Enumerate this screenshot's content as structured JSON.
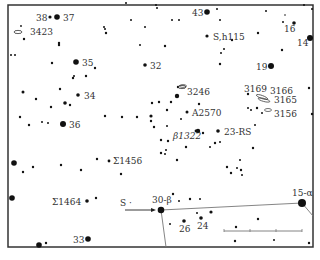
{
  "frame": {
    "x": 8,
    "y": 5,
    "w": 305,
    "h": 242,
    "stroke": "#333333"
  },
  "colors": {
    "ink": "#111111",
    "line": "#777777",
    "text": "#333333"
  },
  "labeled_objects": [
    {
      "id": "38",
      "label": "38",
      "x": 50,
      "y": 17,
      "r": 1.6,
      "lx": 36,
      "ly": 21
    },
    {
      "id": "37",
      "label": "37",
      "x": 57,
      "y": 17,
      "r": 2.8,
      "lx": 63,
      "ly": 21
    },
    {
      "id": "3423",
      "label": "3423",
      "x": 23,
      "y": 31,
      "r": 0,
      "lx": 30,
      "ly": 35,
      "galaxy": true
    },
    {
      "id": "35",
      "label": "35",
      "x": 76,
      "y": 62,
      "r": 2.8,
      "lx": 82,
      "ly": 66
    },
    {
      "id": "32",
      "label": "32",
      "x": 145,
      "y": 65,
      "r": 1.8,
      "lx": 150,
      "ly": 69
    },
    {
      "id": "34",
      "label": "34",
      "x": 78,
      "y": 95,
      "r": 1.8,
      "lx": 84,
      "ly": 99
    },
    {
      "id": "36",
      "label": "36",
      "x": 63,
      "y": 124,
      "r": 3.0,
      "lx": 69,
      "ly": 128
    },
    {
      "id": "43",
      "label": "43",
      "x": 207,
      "y": 12,
      "r": 2.8,
      "lx": 192,
      "ly": 16
    },
    {
      "id": "S,h115",
      "label": "S,h115",
      "x": 207,
      "y": 36,
      "r": 1.6,
      "lx": 213,
      "ly": 40
    },
    {
      "id": "16",
      "label": "16",
      "x": 294,
      "y": 23,
      "r": 1.8,
      "lx": 284,
      "ly": 32
    },
    {
      "id": "14",
      "label": "14",
      "x": 310,
      "y": 38,
      "r": 3.0,
      "lx": 297,
      "ly": 46
    },
    {
      "id": "19",
      "label": "19",
      "x": 271,
      "y": 66,
      "r": 3.0,
      "lx": 256,
      "ly": 70
    },
    {
      "id": "3246",
      "label": "3246",
      "x": 187,
      "y": 86,
      "r": 0,
      "lx": 187,
      "ly": 95,
      "galaxy": true
    },
    {
      "id": "A2570",
      "label": "A2570",
      "x": 187,
      "y": 112,
      "r": 1.5,
      "lx": 192,
      "ly": 116
    },
    {
      "id": "23-RS",
      "label": "23-RS",
      "x": 218,
      "y": 131,
      "r": 1.8,
      "lx": 224,
      "ly": 135
    },
    {
      "id": "B1322",
      "label": "β1322",
      "x": 198,
      "y": 131,
      "r": 2.2,
      "lx": 173,
      "ly": 139,
      "italic": true
    },
    {
      "id": "3169",
      "label": "3169",
      "x": 248,
      "y": 94,
      "r": 1.2,
      "lx": 244,
      "ly": 92
    },
    {
      "id": "3166",
      "label": "3166",
      "x": 0,
      "y": 0,
      "r": 0,
      "lx": 270,
      "ly": 94
    },
    {
      "id": "3165",
      "label": "3165",
      "x": 0,
      "y": 0,
      "r": 0,
      "lx": 274,
      "ly": 103
    },
    {
      "id": "3156",
      "label": "3156",
      "x": 0,
      "y": 0,
      "r": 0,
      "lx": 274,
      "ly": 117
    },
    {
      "id": "S1456",
      "label": "Σ1456",
      "x": 109,
      "y": 161,
      "r": 1.4,
      "lx": 113,
      "ly": 164
    },
    {
      "id": "S1464",
      "label": "Σ1464",
      "x": 87,
      "y": 201,
      "r": 1.8,
      "lx": 52,
      "ly": 205
    },
    {
      "id": "S",
      "label": "S ·",
      "x": 0,
      "y": 0,
      "r": 0,
      "lx": 120,
      "ly": 206
    },
    {
      "id": "30-B",
      "label": "30-β",
      "x": 161,
      "y": 210,
      "r": 3.3,
      "lx": 152,
      "ly": 203
    },
    {
      "id": "26",
      "label": "26",
      "x": 184,
      "y": 221,
      "r": 1.8,
      "lx": 179,
      "ly": 232
    },
    {
      "id": "24",
      "label": "24",
      "x": 201,
      "y": 218,
      "r": 1.8,
      "lx": 197,
      "ly": 229
    },
    {
      "id": "15-a",
      "label": "15-α",
      "x": 302,
      "y": 203,
      "r": 4.0,
      "lx": 292,
      "ly": 196
    },
    {
      "id": "33",
      "label": "33",
      "x": 88,
      "y": 239,
      "r": 2.8,
      "lx": 73,
      "ly": 243
    }
  ],
  "stars": [
    [
      21,
      26,
      0.9
    ],
    [
      24,
      39,
      1.2
    ],
    [
      59,
      45,
      1.2
    ],
    [
      11,
      55,
      1.0
    ],
    [
      15,
      55,
      1.0
    ],
    [
      52,
      63,
      1.2
    ],
    [
      95,
      68,
      1.2
    ],
    [
      73,
      78,
      1.2
    ],
    [
      74,
      76,
      1.0
    ],
    [
      86,
      76,
      1.2
    ],
    [
      23,
      92,
      1.5
    ],
    [
      36,
      99,
      1.2
    ],
    [
      60,
      89,
      1.2
    ],
    [
      65,
      103,
      1.8
    ],
    [
      70,
      105,
      1.2
    ],
    [
      51,
      107,
      1.2
    ],
    [
      20,
      117,
      1.2
    ],
    [
      29,
      125,
      1.2
    ],
    [
      42,
      122,
      1.0
    ],
    [
      48,
      123,
      1.0
    ],
    [
      105,
      116,
      1.2
    ],
    [
      122,
      117,
      1.2
    ],
    [
      137,
      117,
      1.2
    ],
    [
      151,
      116,
      1.6
    ],
    [
      159,
      102,
      1.2
    ],
    [
      14,
      163,
      2.8
    ],
    [
      23,
      172,
      1.2
    ],
    [
      33,
      167,
      1.2
    ],
    [
      61,
      165,
      1.2
    ],
    [
      81,
      170,
      1.2
    ],
    [
      97,
      159,
      1.2
    ],
    [
      121,
      174,
      1.2
    ],
    [
      12,
      198,
      2.8
    ],
    [
      96,
      198,
      1.2
    ],
    [
      39,
      245,
      2.8
    ],
    [
      46,
      243,
      1.2
    ],
    [
      156,
      5,
      1.0
    ],
    [
      172,
      20,
      1.0
    ],
    [
      179,
      20,
      1.0
    ],
    [
      104,
      27,
      1.0
    ],
    [
      106,
      33,
      1.2
    ],
    [
      105,
      29,
      1.0
    ],
    [
      59,
      43,
      1.2
    ],
    [
      165,
      46,
      1.2
    ],
    [
      157,
      8,
      1.0
    ],
    [
      220,
      20,
      1.0
    ],
    [
      217,
      9,
      1.0
    ],
    [
      232,
      40,
      1.2
    ],
    [
      224,
      49,
      1.0
    ],
    [
      221,
      53,
      1.0
    ],
    [
      220,
      64,
      1.2
    ],
    [
      258,
      33,
      1.2
    ],
    [
      282,
      50,
      1.2
    ],
    [
      283,
      22,
      1.0
    ],
    [
      285,
      15,
      0.8
    ],
    [
      178,
      87,
      1.2
    ],
    [
      177,
      96,
      2.2
    ],
    [
      171,
      102,
      1.2
    ],
    [
      152,
      103,
      1.2
    ],
    [
      167,
      110,
      1.2
    ],
    [
      181,
      119,
      1.0
    ],
    [
      151,
      121,
      1.2
    ],
    [
      154,
      127,
      1.2
    ],
    [
      167,
      126,
      1.0
    ],
    [
      161,
      140,
      1.2
    ],
    [
      168,
      141,
      1.2
    ],
    [
      196,
      131,
      1.4
    ],
    [
      203,
      133,
      1.2
    ],
    [
      215,
      143,
      1.2
    ],
    [
      210,
      147,
      1.0
    ],
    [
      220,
      142,
      1.0
    ],
    [
      186,
      147,
      1.2
    ],
    [
      161,
      153,
      1.2
    ],
    [
      166,
      150,
      1.0
    ],
    [
      177,
      160,
      1.2
    ],
    [
      165,
      154,
      1.0
    ],
    [
      199,
      104,
      1.2
    ],
    [
      248,
      108,
      1.0
    ],
    [
      251,
      110,
      1.0
    ],
    [
      257,
      108,
      1.2
    ],
    [
      262,
      113,
      1.0
    ],
    [
      255,
      125,
      1.0
    ],
    [
      312,
      114,
      1.2
    ],
    [
      253,
      148,
      1.2
    ],
    [
      231,
      173,
      1.2
    ],
    [
      237,
      168,
      1.0
    ],
    [
      241,
      170,
      1.2
    ],
    [
      227,
      167,
      1.2
    ],
    [
      240,
      160,
      1.0
    ],
    [
      242,
      175,
      1.0
    ],
    [
      173,
      194,
      1.2
    ],
    [
      179,
      201,
      1.0
    ],
    [
      190,
      199,
      1.2
    ],
    [
      200,
      199,
      1.0
    ],
    [
      197,
      213,
      1.0
    ],
    [
      211,
      212,
      1.6
    ],
    [
      170,
      224,
      1.0
    ],
    [
      236,
      227,
      1.2
    ],
    [
      258,
      219,
      1.2
    ],
    [
      235,
      241,
      1.2
    ],
    [
      309,
      243,
      1.2
    ],
    [
      274,
      240,
      1.0
    ],
    [
      312,
      9,
      1.0
    ],
    [
      304,
      5,
      1.0
    ],
    [
      266,
      11,
      1.0
    ],
    [
      309,
      88,
      1.2
    ],
    [
      126,
      3,
      1.0
    ],
    [
      131,
      20,
      1.0
    ],
    [
      145,
      27,
      1.0
    ],
    [
      140,
      45,
      1.0
    ]
  ],
  "lines": [
    {
      "x1": 161,
      "y1": 210,
      "x2": 302,
      "y2": 203
    },
    {
      "x1": 161,
      "y1": 210,
      "x2": 166,
      "y2": 247
    },
    {
      "x1": 302,
      "y1": 203,
      "x2": 313,
      "y2": 216
    }
  ],
  "pointer_arrow": {
    "x1": 125,
    "y1": 210,
    "x2": 156,
    "y2": 210
  },
  "scale_bar": {
    "x1": 224,
    "x2": 302,
    "y": 231,
    "ticks": [
      224,
      250,
      276,
      302
    ]
  }
}
